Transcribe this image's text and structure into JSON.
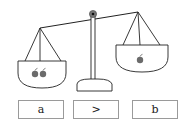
{
  "diagram": {
    "type": "balance-scale",
    "left_pan": {
      "item": "apple",
      "count": 2
    },
    "right_pan": {
      "item": "apple",
      "count": 1
    },
    "tilt": "left pan lower"
  },
  "answer_boxes": [
    {
      "label": "a"
    },
    {
      "label": ">"
    },
    {
      "label": "b"
    }
  ],
  "colors": {
    "line": "#222222",
    "apple": "#6b6b6b",
    "box_border": "#9a9a9a"
  }
}
